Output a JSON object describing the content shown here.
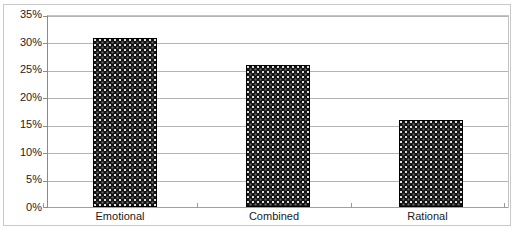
{
  "chart_data": {
    "type": "bar",
    "title": "",
    "xlabel": "",
    "ylabel": "",
    "categories": [
      "Emotional",
      "Combined",
      "Rational"
    ],
    "values": [
      31,
      26,
      16
    ],
    "value_labels": [
      "31%",
      "26%",
      "16%"
    ],
    "ylim": [
      0,
      35
    ],
    "ytick_values": [
      0,
      5,
      10,
      15,
      20,
      25,
      30,
      35
    ],
    "ytick_labels": [
      "0%",
      "5%",
      "10%",
      "15%",
      "20%",
      "25%",
      "30%",
      "35%"
    ],
    "grid": true,
    "legend": false,
    "legend_position": "none",
    "series": [
      {
        "name": "",
        "values": [
          31,
          26,
          16
        ]
      }
    ],
    "colors": {
      "bar_fill": "#121212",
      "bar_pattern_dot": "#ebebeb",
      "bar_border": "#000000",
      "gridline": "#b4b4b4",
      "axis_line": "#8a8a8a",
      "plot_border": "#c4c4c4",
      "frame_border": "#c9c9c9",
      "background": "#ffffff",
      "text": "#1a1a1a"
    }
  },
  "axis": {
    "y_tick_0": "0%",
    "y_tick_1": "5%",
    "y_tick_2": "10%",
    "y_tick_3": "15%",
    "y_tick_4": "20%",
    "y_tick_5": "25%",
    "y_tick_6": "30%",
    "y_tick_7": "35%"
  },
  "categories": {
    "cat_0": "Emotional",
    "cat_1": "Combined",
    "cat_2": "Rational"
  },
  "clipped_title": {
    "ghost_text": "· · · · · · · · ·"
  }
}
